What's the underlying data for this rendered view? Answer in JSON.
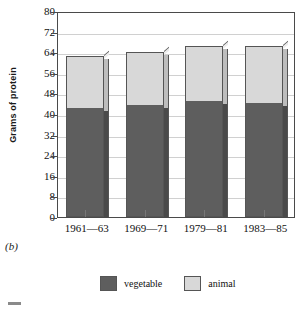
{
  "panel_label": "(b)",
  "chart_data": {
    "type": "bar",
    "subtype": "stacked-column",
    "title": "",
    "xlabel": "",
    "ylabel": "Grams of protein",
    "ylim": [
      0,
      80
    ],
    "ytick_step": 8,
    "yticks": [
      "80",
      "72",
      "64",
      "56",
      "48",
      "40",
      "32",
      "24",
      "16",
      "8",
      "0"
    ],
    "ytick_values": [
      80,
      72,
      64,
      56,
      48,
      40,
      32,
      24,
      16,
      8,
      0
    ],
    "categories": [
      "1961—63",
      "1969—71",
      "1979—81",
      "1983—85"
    ],
    "grid": true,
    "legend_position": "bottom",
    "series": [
      {
        "name": "vegetable",
        "color": "#5e5e5e",
        "values": [
          42,
          43,
          44.5,
          44
        ]
      },
      {
        "name": "animal",
        "color": "#d8d8d8",
        "values": [
          20.5,
          21,
          22,
          22.5
        ]
      }
    ],
    "totals": [
      62.5,
      64,
      66.5,
      66.5
    ]
  },
  "legend": {
    "items": [
      {
        "label": "vegetable",
        "color": "#5e5e5e"
      },
      {
        "label": "animal",
        "color": "#d8d8d8"
      }
    ]
  }
}
